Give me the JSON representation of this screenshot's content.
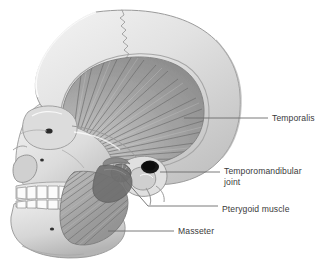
{
  "diagram": {
    "background_color": "#ffffff",
    "label_color": "#3a3a3a",
    "leader_color": "#6b6b6b",
    "bone_light": "#ededed",
    "bone_mid": "#d9d9d9",
    "bone_shadow": "#b9b9b9",
    "muscle_light": "#c9c9c9",
    "muscle_mid": "#a8a8a8",
    "muscle_dark": "#6f6f6f",
    "tooth_color": "#fbfbfb",
    "foramen_color": "#2b2b2b"
  },
  "labels": [
    {
      "id": "temporalis",
      "text": "Temporalis",
      "x": 272,
      "y": 114,
      "leader": {
        "x1": 184,
        "y1": 118,
        "x2": 268,
        "y2": 118
      }
    },
    {
      "id": "temporomandibular-joint",
      "text": "Temporomandibular\njoint",
      "x": 224,
      "y": 167,
      "leader": {
        "x1": 160,
        "y1": 172,
        "x2": 220,
        "y2": 172
      }
    },
    {
      "id": "pterygoid-muscle",
      "text": "Pterygoid muscle",
      "x": 222,
      "y": 205,
      "leader_path": "M120,174 L148,206 L218,206"
    },
    {
      "id": "masseter",
      "text": "Masseter",
      "x": 178,
      "y": 227,
      "leader": {
        "x1": 108,
        "y1": 231,
        "x2": 174,
        "y2": 231
      }
    }
  ],
  "structures": [
    {
      "id": "cranium",
      "name": "Cranium"
    },
    {
      "id": "coronal-suture",
      "name": "Coronal suture"
    },
    {
      "id": "temporalis-muscle",
      "name": "Temporalis muscle"
    },
    {
      "id": "masseter-muscle",
      "name": "Masseter muscle"
    },
    {
      "id": "pterygoid-muscle-structure",
      "name": "Pterygoid muscle"
    },
    {
      "id": "mandible",
      "name": "Mandible"
    },
    {
      "id": "maxillary-teeth",
      "name": "Maxillary teeth"
    },
    {
      "id": "mandibular-teeth",
      "name": "Mandibular teeth"
    },
    {
      "id": "orbit",
      "name": "Orbit"
    },
    {
      "id": "nasal-aperture",
      "name": "Nasal aperture"
    },
    {
      "id": "external-acoustic-meatus",
      "name": "External acoustic meatus"
    },
    {
      "id": "zygomatic-arch",
      "name": "Zygomatic arch"
    },
    {
      "id": "mental-foramen",
      "name": "Mental foramen"
    }
  ]
}
